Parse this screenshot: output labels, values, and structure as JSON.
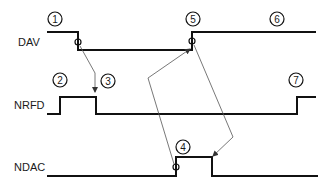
{
  "diagram": {
    "type": "timing-diagram",
    "signals": [
      {
        "name": "DAV"
      },
      {
        "name": "NRFD"
      },
      {
        "name": "NDAC"
      }
    ],
    "markers": [
      "1",
      "2",
      "3",
      "4",
      "5",
      "6",
      "7"
    ],
    "colors": {
      "trace": "#111111",
      "arrow": "#555555",
      "background": "#ffffff"
    }
  }
}
